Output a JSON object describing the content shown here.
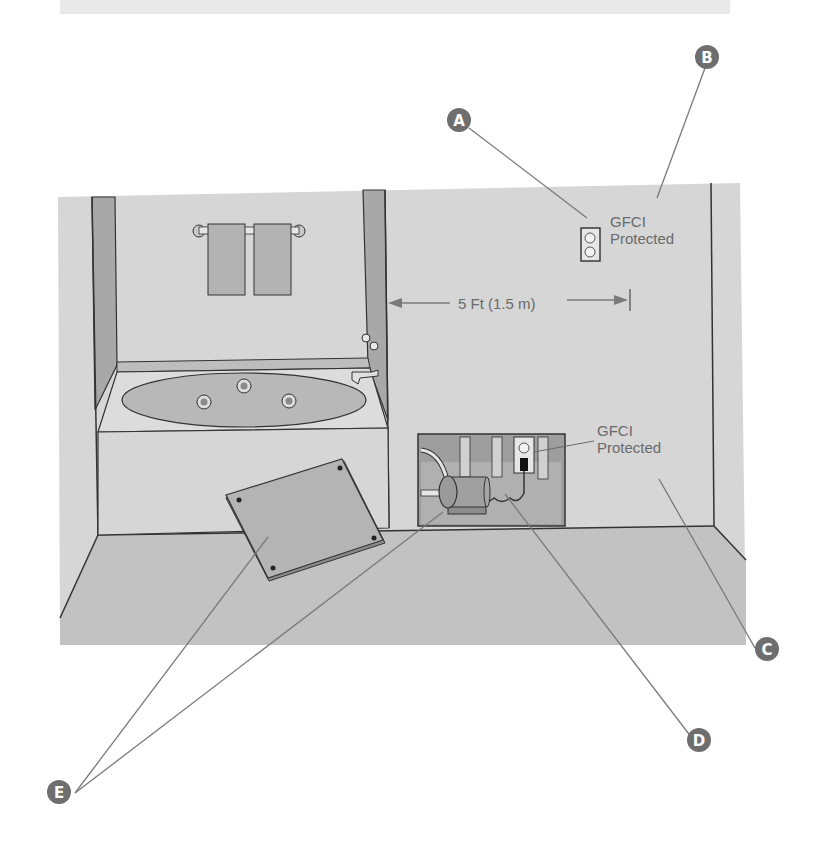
{
  "diagram": {
    "type": "bathroom-gfci-illustration",
    "colors": {
      "wall": "#d4d4d4",
      "floor": "#bfbfbf",
      "trim": "#999999",
      "line": "#333333",
      "marker": "#6e6e6e",
      "leader": "#7a7a7a",
      "text": "#6a6a6a"
    },
    "labels": {
      "outlet_upper": {
        "line1": "GFCI",
        "line2": "Protected"
      },
      "outlet_lower": {
        "line1": "GFCI",
        "line2": "Protected"
      },
      "distance": "5 Ft (1.5 m)"
    },
    "markers": [
      {
        "id": "A",
        "letter": "A",
        "points_to": "wall outlet"
      },
      {
        "id": "B",
        "letter": "B",
        "points_to": "wall"
      },
      {
        "id": "C",
        "letter": "C",
        "points_to": "wall"
      },
      {
        "id": "D",
        "letter": "D",
        "points_to": "pump motor"
      },
      {
        "id": "E",
        "letter": "E",
        "points_to": "access panel and motor"
      }
    ]
  }
}
